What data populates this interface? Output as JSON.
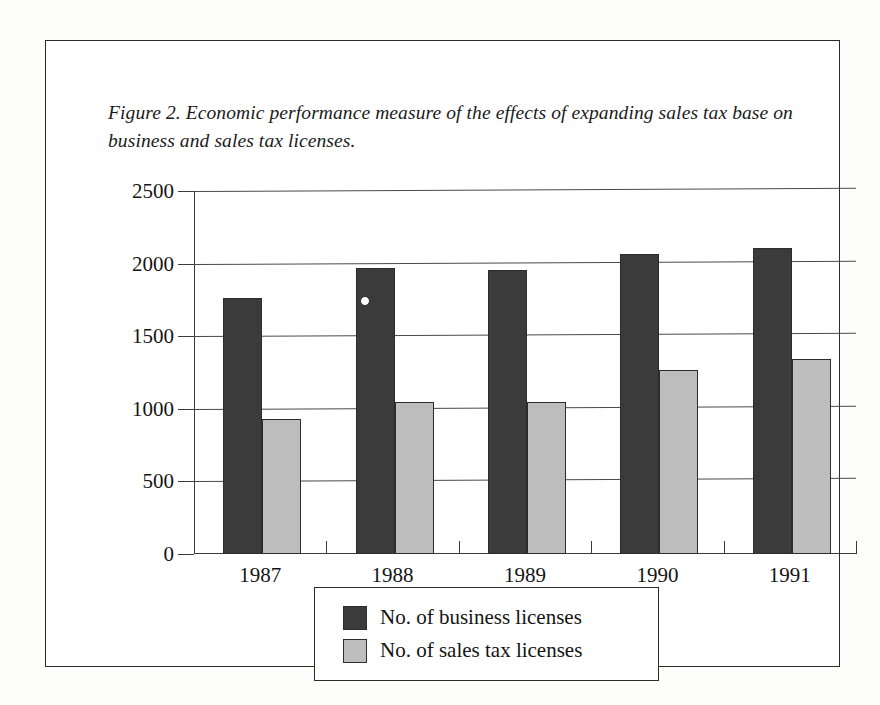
{
  "figure": {
    "caption": "Figure 2. Economic performance measure of the effects of expanding sales tax base on business and sales tax licenses.",
    "frame_color": "#2b2b2b"
  },
  "legend": {
    "position": "bottom-center",
    "entries": [
      {
        "label": "No. of business licenses",
        "color": "#3b3b3b",
        "swatch": "dark-square-swatch"
      },
      {
        "label": "No. of sales tax licenses",
        "color": "#bdbdbd",
        "swatch": "light-square-swatch"
      }
    ]
  },
  "chart_data": {
    "type": "bar",
    "title": "Figure 2. Economic performance measure of the effects of expanding sales tax base on business and sales tax licenses.",
    "xlabel": "",
    "ylabel": "",
    "categories": [
      "1987",
      "1988",
      "1989",
      "1990",
      "1991"
    ],
    "series": [
      {
        "name": "No. of business licenses",
        "color": "#3b3b3b",
        "values": [
          1760,
          1970,
          1955,
          2065,
          2105
        ]
      },
      {
        "name": "No. of sales tax licenses",
        "color": "#bdbdbd",
        "values": [
          930,
          1045,
          1050,
          1265,
          1345
        ]
      }
    ],
    "ylim": [
      0,
      2500
    ],
    "yticks": [
      0,
      500,
      1000,
      1500,
      2000,
      2500
    ],
    "ytick_labels": [
      "0",
      "500",
      "1000",
      "1500",
      "2000",
      "2500"
    ],
    "grid": true,
    "grid_axis": "y",
    "legend_position": "bottom-center"
  }
}
